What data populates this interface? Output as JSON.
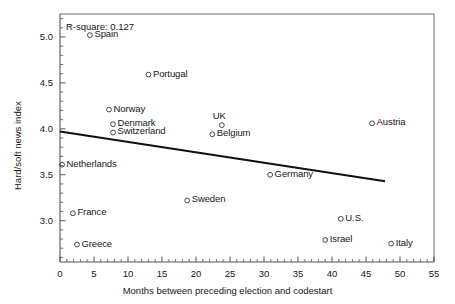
{
  "chart_data": {
    "type": "scatter",
    "title": "",
    "xlabel": "Months between preceding election and codestart",
    "ylabel": "Hard/soft news index",
    "xlim": [
      0,
      55
    ],
    "ylim": [
      2.55,
      5.25
    ],
    "xticks": [
      0,
      5,
      10,
      15,
      20,
      25,
      30,
      35,
      40,
      45,
      50,
      55
    ],
    "xtick_labels": [
      "0",
      "5",
      "10",
      "15",
      "20",
      "25",
      "30",
      "35",
      "40",
      "45",
      "50",
      "55"
    ],
    "yticks": [
      3.0,
      3.5,
      4.0,
      4.5,
      5.0
    ],
    "ytick_labels": [
      "3.0",
      "3.5",
      "4.0",
      "4.5",
      "5.0"
    ],
    "minor_tick_step_x": 1,
    "minor_tick_step_y": 0.1,
    "grid": false,
    "legend": false,
    "annotation": "R-square: 0.127",
    "r_square": 0.127,
    "marker": "open-circle",
    "marker_color": "#333333",
    "trendline": {
      "label": "linear-fit",
      "color": "#111111",
      "x_start": 0,
      "y_start": 3.97,
      "x_end": 47.8,
      "y_end": 3.43
    },
    "points": [
      {
        "label": "Spain",
        "x": 4.4,
        "y": 5.02,
        "label_pos": "right"
      },
      {
        "label": "Portugal",
        "x": 13.0,
        "y": 4.59,
        "label_pos": "right"
      },
      {
        "label": "Norway",
        "x": 7.2,
        "y": 4.21,
        "label_pos": "right"
      },
      {
        "label": "Denmark",
        "x": 7.8,
        "y": 4.05,
        "label_pos": "right"
      },
      {
        "label": "Switzerland",
        "x": 7.8,
        "y": 3.96,
        "label_pos": "right"
      },
      {
        "label": "Netherlands",
        "x": 0.3,
        "y": 3.61,
        "label_pos": "right"
      },
      {
        "label": "France",
        "x": 1.9,
        "y": 3.08,
        "label_pos": "right"
      },
      {
        "label": "Greece",
        "x": 2.5,
        "y": 2.74,
        "label_pos": "right"
      },
      {
        "label": "UK",
        "x": 23.8,
        "y": 4.04,
        "label_pos": "above"
      },
      {
        "label": "Belgium",
        "x": 22.4,
        "y": 3.94,
        "label_pos": "right"
      },
      {
        "label": "Sweden",
        "x": 18.7,
        "y": 3.22,
        "label_pos": "right"
      },
      {
        "label": "Germany",
        "x": 30.9,
        "y": 3.5,
        "label_pos": "right"
      },
      {
        "label": "Austria",
        "x": 45.9,
        "y": 4.06,
        "label_pos": "right"
      },
      {
        "label": "U.S.",
        "x": 41.3,
        "y": 3.02,
        "label_pos": "right"
      },
      {
        "label": "Israel",
        "x": 39.0,
        "y": 2.79,
        "label_pos": "right"
      },
      {
        "label": "Italy",
        "x": 48.7,
        "y": 2.75,
        "label_pos": "right"
      }
    ]
  }
}
